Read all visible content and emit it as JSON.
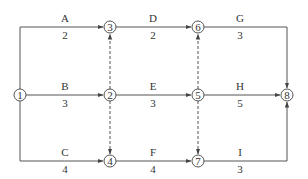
{
  "diagram": {
    "type": "activity-on-arrow network",
    "colors": {
      "line": "#555555",
      "text": "#333333",
      "background": "#ffffff"
    },
    "nodes": [
      {
        "id": "1",
        "x": 20,
        "y": 95
      },
      {
        "id": "2",
        "x": 110,
        "y": 95
      },
      {
        "id": "3",
        "x": 110,
        "y": 27
      },
      {
        "id": "4",
        "x": 110,
        "y": 161
      },
      {
        "id": "5",
        "x": 198,
        "y": 95
      },
      {
        "id": "6",
        "x": 198,
        "y": 27
      },
      {
        "id": "7",
        "x": 198,
        "y": 161
      },
      {
        "id": "8",
        "x": 287,
        "y": 95
      }
    ],
    "activities": [
      {
        "name": "A",
        "duration": "2",
        "from": "1",
        "to": "3"
      },
      {
        "name": "B",
        "duration": "3",
        "from": "1",
        "to": "2"
      },
      {
        "name": "C",
        "duration": "4",
        "from": "1",
        "to": "4"
      },
      {
        "name": "D",
        "duration": "2",
        "from": "3",
        "to": "6"
      },
      {
        "name": "E",
        "duration": "3",
        "from": "2",
        "to": "5"
      },
      {
        "name": "F",
        "duration": "4",
        "from": "4",
        "to": "7"
      },
      {
        "name": "G",
        "duration": "3",
        "from": "6",
        "to": "8"
      },
      {
        "name": "H",
        "duration": "5",
        "from": "5",
        "to": "8"
      },
      {
        "name": "I",
        "duration": "3",
        "from": "7",
        "to": "8"
      }
    ],
    "dummies": [
      {
        "from": "2",
        "to": "3"
      },
      {
        "from": "2",
        "to": "4"
      },
      {
        "from": "5",
        "to": "6"
      },
      {
        "from": "5",
        "to": "7"
      }
    ]
  }
}
